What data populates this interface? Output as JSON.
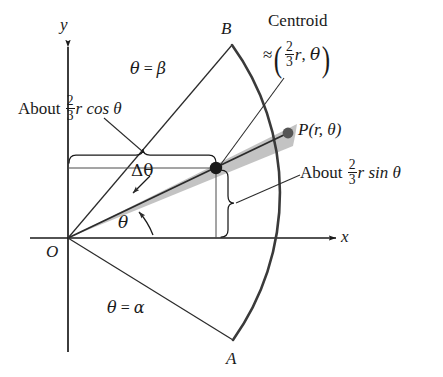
{
  "figure": {
    "title_note": "Polar sector centroid diagram",
    "colors": {
      "ink": "#1a1a1a",
      "thin_line": "#2b2b2b",
      "wedge_fill": "#b7b7b7",
      "arc_stroke": "#3a3a3a",
      "background": "#ffffff"
    }
  },
  "axes": {
    "x_label": "x",
    "y_label": "y",
    "origin_label": "O"
  },
  "points": {
    "B": "B",
    "A": "A",
    "P": "P(r, θ)"
  },
  "rays": {
    "beta_label_theta": "θ",
    "beta_label_eq": "=",
    "beta_label_value": "β",
    "alpha_label_theta": "θ",
    "alpha_label_eq": "=",
    "alpha_label_value": "α"
  },
  "angles": {
    "delta_theta": "Δθ",
    "theta": "θ"
  },
  "callouts": {
    "centroid_title": "Centroid",
    "centroid_approx_sign": "≈",
    "centroid_frac_num": "2",
    "centroid_frac_den": "3",
    "centroid_radius_var": "r",
    "centroid_comma": ",",
    "centroid_angle_var": "θ",
    "cos_about": "About",
    "cos_frac_num": "2",
    "cos_frac_den": "3",
    "cos_expr": "r cos θ",
    "sin_about": "About",
    "sin_frac_num": "2",
    "sin_frac_den": "3",
    "sin_expr": "r sin θ"
  }
}
